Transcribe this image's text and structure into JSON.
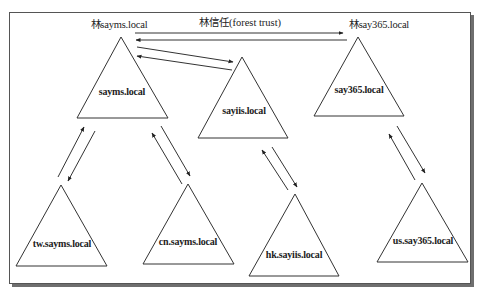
{
  "diagram": {
    "title": "林信任(forest trust)",
    "colors": {
      "line": "#333333",
      "frame": "#555555",
      "shadow": "#6f6f6f",
      "background": "#ffffff"
    },
    "forests": [
      {
        "id": "sayms",
        "forest_label": "林sayms.local",
        "root_domain": "sayms.local",
        "children": [
          {
            "id": "tw",
            "domain": "tw.sayms.local"
          },
          {
            "id": "cn",
            "domain": "cn.sayms.local"
          }
        ]
      },
      {
        "id": "sayiis",
        "forest_label": "",
        "root_domain": "sayiis.local",
        "children": [
          {
            "id": "hk",
            "domain": "hk.sayiis.local"
          }
        ]
      },
      {
        "id": "say365",
        "forest_label": "林say365.local",
        "root_domain": "say365.local",
        "children": [
          {
            "id": "us",
            "domain": "us.say365.local"
          }
        ]
      }
    ],
    "trusts": [
      {
        "from": "sayms.local",
        "to": "say365.local",
        "type": "forest trust",
        "direction": "two-way"
      },
      {
        "from": "sayms.local",
        "to": "sayiis.local",
        "direction": "two-way"
      },
      {
        "from": "sayms.local",
        "to": "tw.sayms.local",
        "direction": "two-way"
      },
      {
        "from": "sayms.local",
        "to": "cn.sayms.local",
        "direction": "two-way"
      },
      {
        "from": "sayiis.local",
        "to": "hk.sayiis.local",
        "direction": "two-way"
      },
      {
        "from": "say365.local",
        "to": "us.say365.local",
        "direction": "two-way"
      }
    ]
  }
}
